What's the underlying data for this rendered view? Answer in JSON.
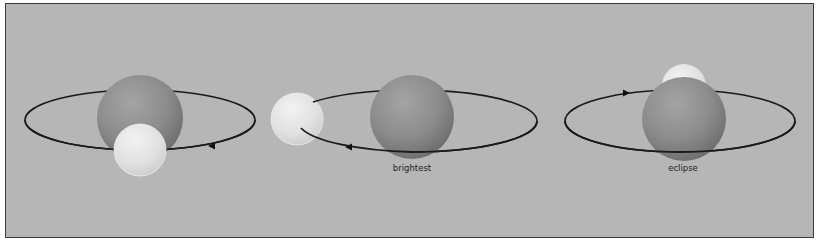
{
  "figure": {
    "panels": [
      {
        "id": "panel-1",
        "label": "",
        "ellipse": {
          "cx": 140,
          "cy": 120,
          "rx": 115,
          "ry": 30
        },
        "star_large": {
          "cx": 140,
          "cy": 118,
          "r": 43
        },
        "star_small": {
          "cx": 140,
          "cy": 150,
          "r": 26,
          "position": "front"
        },
        "arrow": {
          "x": 212,
          "y": 146,
          "direction": "left"
        }
      },
      {
        "id": "panel-2",
        "label": "brightest",
        "ellipse": {
          "cx": 412,
          "cy": 121,
          "rx": 125,
          "ry": 31
        },
        "star_large": {
          "cx": 412,
          "cy": 117,
          "r": 42
        },
        "star_small": {
          "cx": 297,
          "cy": 119,
          "r": 26,
          "position": "side"
        },
        "arrow": {
          "x": 349,
          "y": 146,
          "direction": "left"
        }
      },
      {
        "id": "panel-3",
        "label": "eclipse",
        "ellipse": {
          "cx": 680,
          "cy": 121,
          "rx": 115,
          "ry": 31
        },
        "star_large": {
          "cx": 684,
          "cy": 119,
          "r": 42
        },
        "star_small": {
          "cx": 684,
          "cy": 86,
          "r": 22,
          "position": "behind"
        },
        "arrow": {
          "x": 627,
          "y": 93,
          "direction": "right"
        }
      }
    ],
    "colors": {
      "background": "#b6b6b6",
      "frame_border": "#3a3a3a",
      "orbit_line": "#1a1a1a",
      "large_star": "#8a8a8a",
      "small_star": "#e4e4e4",
      "label_text": "#1e1e1e"
    }
  }
}
